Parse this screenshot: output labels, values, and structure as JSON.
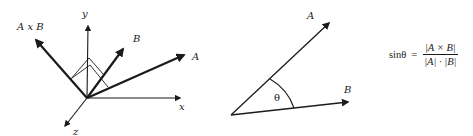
{
  "left_diagram": {
    "title": "3D cross product vectors",
    "axes": {
      "x_label": "x",
      "y_label": "y",
      "z_label": "z"
    },
    "vectors": {
      "cross_label": "A x B",
      "b_label": "B",
      "a_label": "A"
    }
  },
  "middle_diagram": {
    "title": "Angle between vectors",
    "a_label": "A",
    "b_label": "B",
    "angle_label": "θ"
  },
  "formula": {
    "lhs_fn": "sin",
    "lhs_var": "θ",
    "equals": "=",
    "numerator": "|A × B|",
    "denominator": "|A| · |B|"
  },
  "colors": {
    "ink": "#1a1a1a",
    "background": "#ffffff"
  }
}
